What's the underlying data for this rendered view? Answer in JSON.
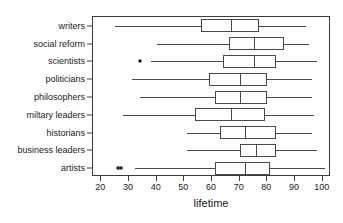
{
  "chart_data": {
    "type": "box",
    "title": "",
    "xlabel": "lifetime",
    "ylabel": "",
    "xlim": [
      17,
      103
    ],
    "xticks": [
      20,
      30,
      40,
      50,
      60,
      70,
      80,
      90,
      100
    ],
    "xtick_labels": [
      "20",
      "30",
      "40",
      "50",
      "60",
      "70",
      "80",
      "90",
      "100"
    ],
    "grid": false,
    "legend": "none",
    "orientation": "horizontal",
    "categories": [
      "writers",
      "social reform",
      "scientists",
      "politicians",
      "philosophers",
      "miltary leaders",
      "historians",
      "business leaders",
      "artists"
    ],
    "boxes": [
      {
        "category": "writers",
        "whisker_low": 25,
        "q1": 56,
        "median": 67,
        "q3": 77,
        "whisker_high": 94,
        "outliers": []
      },
      {
        "category": "social reform",
        "whisker_low": 40,
        "q1": 66,
        "median": 75,
        "q3": 86,
        "whisker_high": 95,
        "outliers": []
      },
      {
        "category": "scientists",
        "whisker_low": 38,
        "q1": 64,
        "median": 75,
        "q3": 83,
        "whisker_high": 98,
        "outliers": [
          34
        ]
      },
      {
        "category": "politicians",
        "whisker_low": 31,
        "q1": 59,
        "median": 70,
        "q3": 80,
        "whisker_high": 96,
        "outliers": []
      },
      {
        "category": "philosophers",
        "whisker_low": 34,
        "q1": 61,
        "median": 70,
        "q3": 80,
        "whisker_high": 96,
        "outliers": []
      },
      {
        "category": "miltary leaders",
        "whisker_low": 28,
        "q1": 54,
        "median": 67,
        "q3": 79,
        "whisker_high": 97,
        "outliers": []
      },
      {
        "category": "historians",
        "whisker_low": 51,
        "q1": 63,
        "median": 72,
        "q3": 83,
        "whisker_high": 96,
        "outliers": []
      },
      {
        "category": "business leaders",
        "whisker_low": 51,
        "q1": 70,
        "median": 76,
        "q3": 83,
        "whisker_high": 98,
        "outliers": []
      },
      {
        "category": "artists",
        "whisker_low": 32,
        "q1": 61,
        "median": 72,
        "q3": 81,
        "whisker_high": 101,
        "outliers": [
          26,
          27
        ]
      }
    ]
  }
}
